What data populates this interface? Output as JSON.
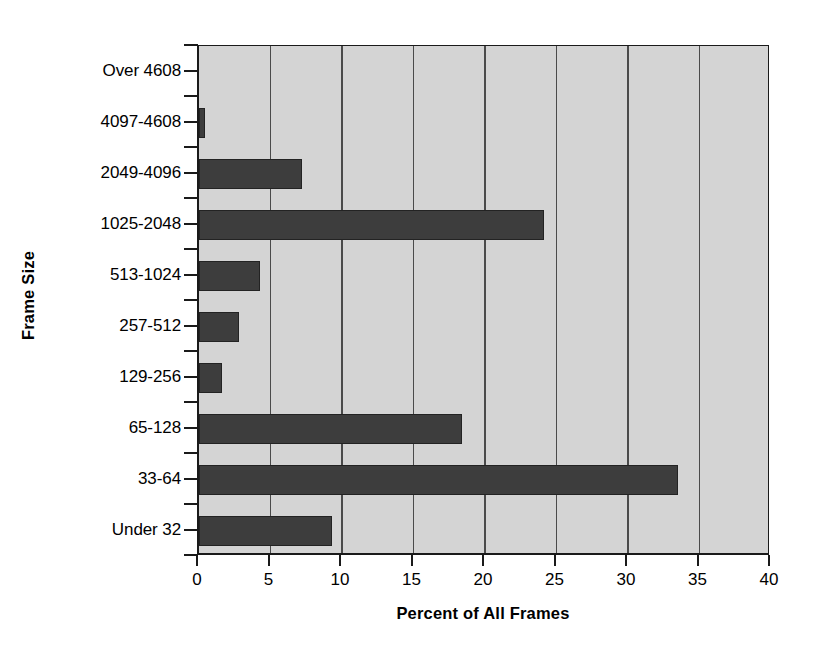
{
  "chart_data": {
    "type": "bar",
    "orientation": "horizontal",
    "title": "",
    "xlabel": "Percent of All Frames",
    "ylabel": "Frame Size",
    "categories": [
      "Over 4608",
      "4097-4608",
      "2049-4096",
      "1025-2048",
      "513-1024",
      "257-512",
      "129-256",
      "65-128",
      "33-64",
      "Under 32"
    ],
    "values": [
      0,
      0.4,
      7.2,
      24.1,
      4.3,
      2.8,
      1.6,
      18.4,
      33.5,
      9.3
    ],
    "xlim": [
      0,
      40
    ],
    "xticks": [
      0,
      5,
      10,
      15,
      20,
      25,
      30,
      35,
      40
    ],
    "xtick_labels": [
      "0",
      "5",
      "10",
      "15",
      "20",
      "25",
      "30",
      "35",
      "40"
    ],
    "grid": "vertical",
    "legend": "none",
    "plot_background_color": "#d4d4d4",
    "bar_color": "#3d3d3d",
    "axis_color": "#1a1a1a",
    "page_background_color": "#ffffff"
  }
}
